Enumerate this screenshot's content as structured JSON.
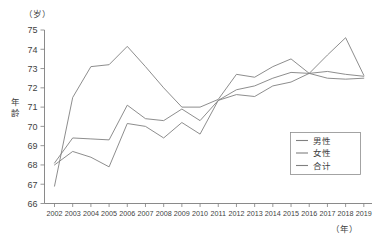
{
  "chart_data": {
    "type": "line",
    "title": "",
    "unit_label": "（岁）",
    "ylabel": "年龄",
    "xlabel": "（年）",
    "ylim": [
      66,
      75
    ],
    "ytick_values": [
      66,
      67,
      68,
      69,
      70,
      71,
      72,
      73,
      74,
      75
    ],
    "ytick_labels": [
      "66",
      "67",
      "68",
      "69",
      "70",
      "71",
      "72",
      "73",
      "74",
      "75"
    ],
    "grid": false,
    "legend_position": "bottom-right",
    "categories": [
      2002,
      2003,
      2004,
      2005,
      2006,
      2007,
      2008,
      2009,
      2010,
      2011,
      2012,
      2013,
      2014,
      2015,
      2016,
      2017,
      2018,
      2019
    ],
    "xtick_labels": [
      "2002",
      "2003",
      "2004",
      "2005",
      "2006",
      "2007",
      "2008",
      "2009",
      "2010",
      "2011",
      "2012",
      "2013",
      "2014",
      "2015",
      "2016",
      "2017",
      "2018",
      "2019"
    ],
    "series": [
      {
        "name": "男性",
        "color": "#808080",
        "values": [
          66.9,
          71.5,
          73.1,
          73.2,
          74.15,
          73.1,
          72.0,
          71.0,
          71.0,
          71.4,
          72.7,
          72.55,
          73.1,
          73.5,
          72.75,
          73.7,
          74.6,
          72.65
        ]
      },
      {
        "name": "女性",
        "color": "#808080",
        "values": [
          68.1,
          69.4,
          69.35,
          69.3,
          71.1,
          70.4,
          70.3,
          70.9,
          70.3,
          71.35,
          71.65,
          71.55,
          72.1,
          72.3,
          72.75,
          72.5,
          72.45,
          72.5
        ]
      },
      {
        "name": "合计",
        "color": "#808080",
        "values": [
          68.0,
          68.7,
          68.4,
          67.9,
          70.15,
          70.0,
          69.4,
          70.2,
          69.6,
          71.35,
          71.9,
          72.1,
          72.5,
          72.8,
          72.75,
          72.85,
          72.7,
          72.6
        ]
      }
    ]
  }
}
